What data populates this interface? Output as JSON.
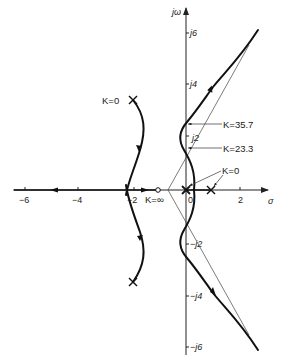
{
  "diagram": {
    "type": "root-locus",
    "axes": {
      "real_label": "σ",
      "imag_label": "jω",
      "real_ticks": [
        {
          "value": -6,
          "label": "−6"
        },
        {
          "value": -4,
          "label": "−4"
        },
        {
          "value": -2,
          "label": "−2"
        },
        {
          "value": 0,
          "label": "0"
        },
        {
          "value": 2,
          "label": "2"
        }
      ],
      "imag_ticks": [
        {
          "value": 6,
          "label": "j6"
        },
        {
          "value": 4,
          "label": "j4"
        },
        {
          "value": 2,
          "label": "j2"
        },
        {
          "value": -2,
          "label": "−j2"
        },
        {
          "value": -4,
          "label": "−j4"
        },
        {
          "value": -6,
          "label": "−j6"
        }
      ],
      "real_range": [
        -6.5,
        3
      ],
      "imag_range": [
        -6.5,
        7
      ]
    },
    "poles": [
      {
        "re": -2,
        "im": 3,
        "label": "K=0"
      },
      {
        "re": -2,
        "im": -3
      },
      {
        "re": 0,
        "im": 0,
        "label": "K=0"
      },
      {
        "re": 1,
        "im": 0
      }
    ],
    "zeros": [
      {
        "re": -1.1,
        "im": 0,
        "label": "K=∞"
      }
    ],
    "annotations": [
      {
        "text": "K=35.7",
        "re": 0,
        "im": 2.4
      },
      {
        "text": "K=23.3",
        "re": 0,
        "im": 1.5
      },
      {
        "text": "K=0",
        "re": 0.5,
        "im": 0
      },
      {
        "text": "K=0",
        "re": -2,
        "im": 3
      },
      {
        "text": "K=∞",
        "re": -1.1,
        "im": 0
      }
    ]
  },
  "labels": {
    "sigma": "σ",
    "jw": "jω",
    "k_35_7": "K=35.7",
    "k_23_3": "K=23.3",
    "k_0_right": "K=0",
    "k_0_left": "K=0",
    "k_inf": "K=∞",
    "tick_m6": "−6",
    "tick_m4": "−4",
    "tick_m2": "−2",
    "tick_0": "0",
    "tick_2": "2",
    "tick_j6": "j6",
    "tick_j4": "j4",
    "tick_j2": "j2",
    "tick_mj2": "−j2",
    "tick_mj4": "−j4",
    "tick_mj6": "−j6"
  }
}
